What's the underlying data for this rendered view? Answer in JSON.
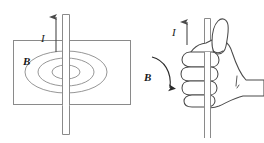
{
  "figure": {
    "stroke_color": "#8a8a8a",
    "dark_stroke_color": "#4a4a4a",
    "label_color": "#1a1a1a",
    "background": "#ffffff"
  },
  "left_panel": {
    "name": "field-plane-diagram",
    "description": "Vertical wire piercing a horizontal plane with three concentric magnetic field ellipses",
    "current_label": "I",
    "field_label": "B",
    "field_line_count": 3,
    "current_direction": "up",
    "plane": {
      "x": 13,
      "y": 40,
      "width": 118,
      "height": 65
    },
    "wire": {
      "x": 62,
      "width": 8,
      "top": 14,
      "bottom": 135
    },
    "ellipses": [
      {
        "cx": 66,
        "cy": 72,
        "rx": 41,
        "ry": 21
      },
      {
        "cx": 66,
        "cy": 72,
        "rx": 28,
        "ry": 14
      },
      {
        "cx": 66,
        "cy": 72,
        "rx": 14,
        "ry": 7
      }
    ]
  },
  "right_panel": {
    "name": "right-hand-rule-diagram",
    "description": "Right hand gripping a vertical rod, thumb up along current, fingers curling in field direction",
    "current_label": "I",
    "field_label": "B",
    "current_direction": "up",
    "field_direction": "counterclockwise-from-viewer",
    "rod": {
      "x": 204,
      "width": 7,
      "top": 18,
      "bottom": 138
    },
    "finger_count": 4,
    "thumb": "up"
  },
  "labels": {
    "current": "I",
    "field": "B"
  }
}
